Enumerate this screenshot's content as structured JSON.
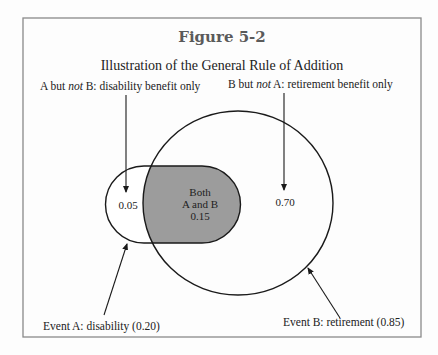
{
  "figure": {
    "label": "Figure 5-2",
    "title": "Illustration of the General Rule of Addition"
  },
  "labels": {
    "a_not_b_prefix": "A but ",
    "a_not_b_italic": "not",
    "a_not_b_suffix": " B: disability benefit only",
    "b_not_a_prefix": "B but ",
    "b_not_a_italic": "not",
    "b_not_a_suffix": " A: retirement benefit only",
    "event_a": "Event A: disability (0.20)",
    "event_b": "Event B: retirement (0.85)"
  },
  "regions": {
    "a_only": "0.05",
    "both_line1": "Both",
    "both_line2": "A and B",
    "both_value": "0.15",
    "b_only": "0.70"
  },
  "colors": {
    "intersection_fill": "#9c9c9c",
    "stroke": "#1a1a1a",
    "frame": "#8a8a8a"
  }
}
